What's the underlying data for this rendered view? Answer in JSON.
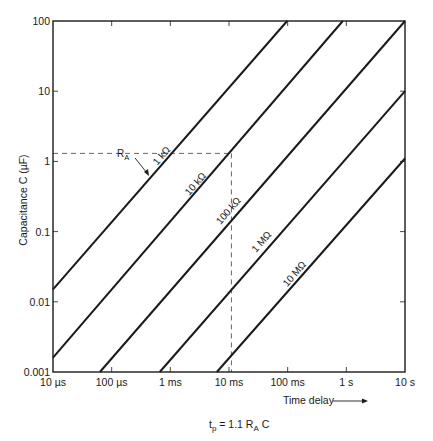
{
  "chart_data": {
    "type": "line",
    "title": "",
    "formula": "t_p = 1.1 R_A C",
    "xlabel": "Time delay",
    "ylabel": "Capacitance C (µF)",
    "xscale": "log",
    "yscale": "log",
    "xlim_seconds": [
      1e-05,
      10
    ],
    "ylim": [
      0.001,
      100
    ],
    "grid": false,
    "legend": "inline labels on lines",
    "x_ticks": [
      {
        "value": 1e-05,
        "label": "10 µs"
      },
      {
        "value": 0.0001,
        "label": "100 µs"
      },
      {
        "value": 0.001,
        "label": "1 ms"
      },
      {
        "value": 0.01,
        "label": "10 ms"
      },
      {
        "value": 0.1,
        "label": "100 ms"
      },
      {
        "value": 1,
        "label": "1 s"
      },
      {
        "value": 10,
        "label": "10 s"
      }
    ],
    "y_ticks": [
      {
        "value": 100,
        "label": "100"
      },
      {
        "value": 10,
        "label": "10"
      },
      {
        "value": 1,
        "label": "1"
      },
      {
        "value": 0.1,
        "label": "0.1"
      },
      {
        "value": 0.01,
        "label": "0.01"
      },
      {
        "value": 0.001,
        "label": "0.001"
      }
    ],
    "series": [
      {
        "name": "1 kΩ",
        "points": [
          {
            "t": 1e-05,
            "c": 0.015
          },
          {
            "t": 0.098,
            "c": 100
          }
        ]
      },
      {
        "name": "10 kΩ",
        "points": [
          {
            "t": 1e-05,
            "c": 0.0016
          },
          {
            "t": 0.87,
            "c": 100
          }
        ]
      },
      {
        "name": "100 kΩ",
        "points": [
          {
            "t": 6.3e-05,
            "c": 0.001
          },
          {
            "t": 10,
            "c": 100
          }
        ]
      },
      {
        "name": "1 MΩ",
        "points": [
          {
            "t": 0.00066,
            "c": 0.001
          },
          {
            "t": 10,
            "c": 10
          }
        ]
      },
      {
        "name": "10 MΩ",
        "points": [
          {
            "t": 0.0062,
            "c": 0.001
          },
          {
            "t": 10,
            "c": 1.1
          }
        ]
      }
    ],
    "annotations": [
      {
        "type": "dashed-guide",
        "t": 0.011,
        "c": 1.3,
        "note": "example reading on 10 kΩ line"
      },
      {
        "type": "arrow-label",
        "text": "R_A",
        "points_to": "1 kΩ line"
      }
    ]
  },
  "labels": {
    "ylabel": "Capacitance C (µF)",
    "xlabel": "Time delay",
    "formula_t": "t",
    "formula_sub_p": "p",
    "formula_mid": " = 1.1 R",
    "formula_sub_a": "A",
    "formula_end": " C",
    "ra_main": "R",
    "ra_sub": "A"
  },
  "colors": {
    "ink": "#1a1a1a",
    "background": "#ffffff",
    "dash": "#555555"
  }
}
